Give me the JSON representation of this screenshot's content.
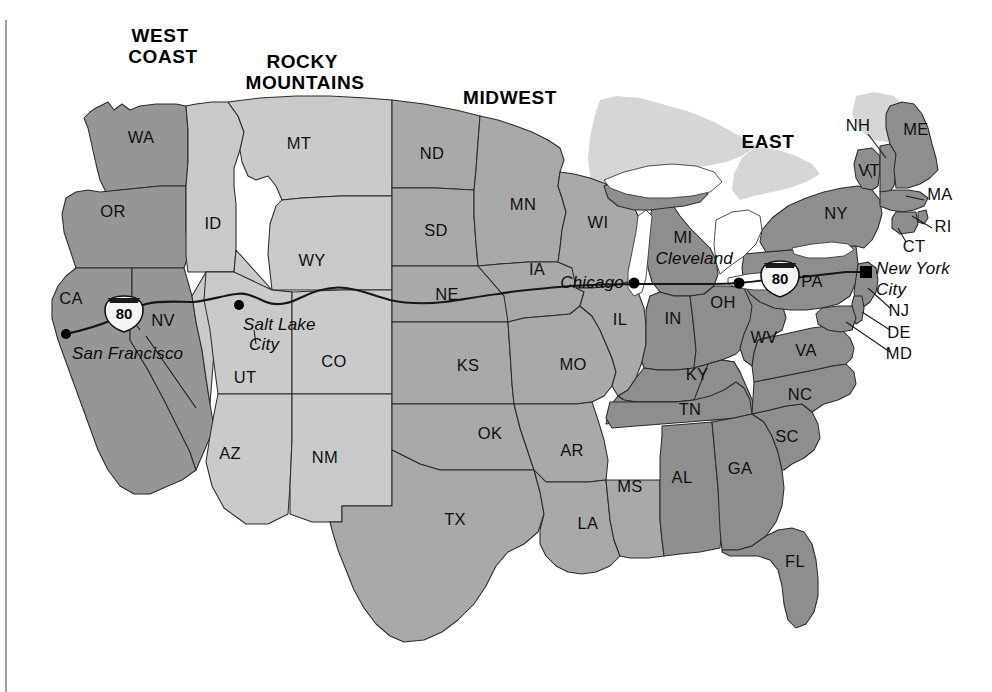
{
  "map": {
    "title": "United States Regions and Interstate 80 Route",
    "regions": [
      {
        "id": "west-coast",
        "label": "WEST COAST",
        "label_lines": [
          "WEST",
          "COAST"
        ],
        "x": 163,
        "y": 36,
        "color": "#969696"
      },
      {
        "id": "rocky-mountains",
        "label": "ROCKY MOUNTAINS",
        "label_lines": [
          "ROCKY",
          "MOUNTAINS"
        ],
        "x": 305,
        "y": 62,
        "color": "#cacaca"
      },
      {
        "id": "midwest",
        "label": "MIDWEST",
        "label_lines": [
          "MIDWEST"
        ],
        "x": 510,
        "y": 104,
        "color": "#a9a9a9"
      },
      {
        "id": "east",
        "label": "EAST",
        "label_lines": [
          "EAST"
        ],
        "x": 768,
        "y": 148,
        "color": "#8e8e8e"
      }
    ],
    "states": [
      {
        "abbr": "WA",
        "region": "west-coast",
        "x": 141,
        "y": 139
      },
      {
        "abbr": "OR",
        "region": "west-coast",
        "x": 113,
        "y": 213
      },
      {
        "abbr": "CA",
        "region": "west-coast",
        "x": 71,
        "y": 300
      },
      {
        "abbr": "NV",
        "region": "west-coast",
        "x": 163,
        "y": 322
      },
      {
        "abbr": "ID",
        "region": "rocky-mountains",
        "x": 213,
        "y": 225
      },
      {
        "abbr": "MT",
        "region": "rocky-mountains",
        "x": 299,
        "y": 145
      },
      {
        "abbr": "WY",
        "region": "rocky-mountains",
        "x": 312,
        "y": 262
      },
      {
        "abbr": "UT",
        "region": "rocky-mountains",
        "x": 245,
        "y": 379
      },
      {
        "abbr": "CO",
        "region": "rocky-mountains",
        "x": 334,
        "y": 363
      },
      {
        "abbr": "AZ",
        "region": "rocky-mountains",
        "x": 230,
        "y": 455
      },
      {
        "abbr": "NM",
        "region": "rocky-mountains",
        "x": 325,
        "y": 459
      },
      {
        "abbr": "ND",
        "region": "midwest",
        "x": 432,
        "y": 155
      },
      {
        "abbr": "SD",
        "region": "midwest",
        "x": 436,
        "y": 232
      },
      {
        "abbr": "NE",
        "region": "midwest",
        "x": 447,
        "y": 296
      },
      {
        "abbr": "KS",
        "region": "midwest",
        "x": 468,
        "y": 367
      },
      {
        "abbr": "OK",
        "region": "midwest",
        "x": 490,
        "y": 435
      },
      {
        "abbr": "TX",
        "region": "midwest",
        "x": 455,
        "y": 521
      },
      {
        "abbr": "MN",
        "region": "midwest",
        "x": 523,
        "y": 206
      },
      {
        "abbr": "IA",
        "region": "midwest",
        "x": 537,
        "y": 271
      },
      {
        "abbr": "MO",
        "region": "midwest",
        "x": 573,
        "y": 366
      },
      {
        "abbr": "AR",
        "region": "midwest",
        "x": 572,
        "y": 452
      },
      {
        "abbr": "LA",
        "region": "midwest",
        "x": 588,
        "y": 525
      },
      {
        "abbr": "WI",
        "region": "midwest",
        "x": 598,
        "y": 224
      },
      {
        "abbr": "IL",
        "region": "midwest",
        "x": 620,
        "y": 321
      },
      {
        "abbr": "MS",
        "region": "midwest",
        "x": 630,
        "y": 488
      },
      {
        "abbr": "MI",
        "region": "east",
        "x": 683,
        "y": 239
      },
      {
        "abbr": "IN",
        "region": "east",
        "x": 673,
        "y": 320
      },
      {
        "abbr": "OH",
        "region": "east",
        "x": 723,
        "y": 304
      },
      {
        "abbr": "KY",
        "region": "east",
        "x": 697,
        "y": 376
      },
      {
        "abbr": "TN",
        "region": "east",
        "x": 690,
        "y": 411
      },
      {
        "abbr": "AL",
        "region": "east",
        "x": 682,
        "y": 479
      },
      {
        "abbr": "GA",
        "region": "east",
        "x": 740,
        "y": 470
      },
      {
        "abbr": "FL",
        "region": "east",
        "x": 795,
        "y": 563
      },
      {
        "abbr": "SC",
        "region": "east",
        "x": 787,
        "y": 438
      },
      {
        "abbr": "NC",
        "region": "east",
        "x": 800,
        "y": 396
      },
      {
        "abbr": "VA",
        "region": "east",
        "x": 806,
        "y": 352
      },
      {
        "abbr": "WV",
        "region": "east",
        "x": 764,
        "y": 339
      },
      {
        "abbr": "PA",
        "region": "east",
        "x": 812,
        "y": 283
      },
      {
        "abbr": "NY",
        "region": "east",
        "x": 836,
        "y": 215
      },
      {
        "abbr": "VT",
        "region": "east",
        "x": 869,
        "y": 172
      },
      {
        "abbr": "NH",
        "region": "east",
        "x": 858,
        "y": 127
      },
      {
        "abbr": "ME",
        "region": "east",
        "x": 916,
        "y": 131
      },
      {
        "abbr": "MA",
        "region": "east",
        "x": 940,
        "y": 196
      },
      {
        "abbr": "RI",
        "region": "east",
        "x": 943,
        "y": 228
      },
      {
        "abbr": "CT",
        "region": "east",
        "x": 914,
        "y": 248
      },
      {
        "abbr": "NJ",
        "region": "east",
        "x": 899,
        "y": 312
      },
      {
        "abbr": "DE",
        "region": "east",
        "x": 899,
        "y": 334
      },
      {
        "abbr": "MD",
        "region": "east",
        "x": 899,
        "y": 355
      }
    ],
    "cities": [
      {
        "name": "San Francisco",
        "label": "San Francisco",
        "dot_x": 66,
        "dot_y": 334,
        "label_x": 72,
        "label_y": 359,
        "anchor": "start"
      },
      {
        "name": "Salt Lake City",
        "label": "Salt Lake City",
        "label_lines": [
          "Salt Lake",
          "City"
        ],
        "dot_x": 239,
        "dot_y": 305,
        "label_x": 243,
        "label_y": 330,
        "anchor": "start"
      },
      {
        "name": "Chicago",
        "label": "Chicago",
        "dot_x": 634,
        "dot_y": 283,
        "label_x": 624,
        "label_y": 283,
        "anchor": "end"
      },
      {
        "name": "Cleveland",
        "label": "Cleveland",
        "dot_x": 739,
        "dot_y": 283,
        "label_x": 733,
        "label_y": 262,
        "anchor": "end"
      },
      {
        "name": "New York City",
        "label": "New York City",
        "label_lines": [
          "New York",
          "City"
        ],
        "dot_x": 866,
        "dot_y": 272,
        "label_x": 874,
        "label_y": 274,
        "anchor": "start"
      }
    ],
    "highway_shields": [
      {
        "route": "80",
        "x": 124,
        "y": 313
      },
      {
        "route": "80",
        "x": 780,
        "y": 278
      }
    ],
    "colors": {
      "west_coast": "#969696",
      "rocky_mountains": "#cacaca",
      "midwest": "#a9a9a9",
      "east": "#8e8e8e",
      "backdrop": "#d6d6d6",
      "lake": "#ffffff",
      "border": "#2b2b2b",
      "route": "#161616",
      "page": "#ffffff"
    }
  }
}
